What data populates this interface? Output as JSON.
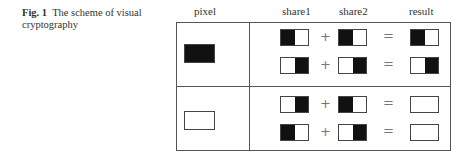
{
  "caption": {
    "label": "Fig. 1",
    "text": "The scheme of visual cryptography"
  },
  "headers": {
    "pixel": "pixel",
    "share1": "share1",
    "share2": "share2",
    "result": "result"
  },
  "operators": {
    "plus": "+",
    "equals": "="
  },
  "rows": [
    {
      "pixel": "black",
      "cases": [
        {
          "share1": [
            "black",
            "white"
          ],
          "share2": [
            "black",
            "white"
          ],
          "result": [
            "black",
            "white"
          ]
        },
        {
          "share1": [
            "white",
            "black"
          ],
          "share2": [
            "white",
            "black"
          ],
          "result": [
            "white",
            "black"
          ]
        }
      ]
    },
    {
      "pixel": "white",
      "cases": [
        {
          "share1": [
            "white",
            "black"
          ],
          "share2": [
            "black",
            "white"
          ],
          "result": [
            "white",
            "white"
          ]
        },
        {
          "share1": [
            "black",
            "white"
          ],
          "share2": [
            "white",
            "black"
          ],
          "result": [
            "white",
            "white"
          ]
        }
      ]
    }
  ]
}
